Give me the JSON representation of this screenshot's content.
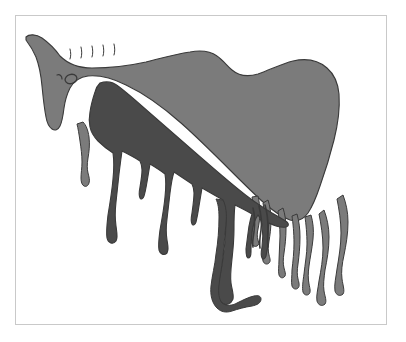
{
  "artwork": {
    "title": "Two-tone horse figure with paint drips",
    "style": "rock-art silhouette illustration",
    "caption": "",
    "background_color": "#ffffff",
    "frame": {
      "border_color": "#c9c9c9",
      "border_width_px": 1,
      "inset_left_px": 15,
      "inset_top_px": 15,
      "width_px": 372,
      "height_px": 310
    },
    "canvas": {
      "width_px": 406,
      "height_px": 342
    },
    "palette": {
      "light_gray": "#7b7b7b",
      "dark_gray": "#4a4a4a",
      "outline": "#3a3a3a",
      "paper": "#ffffff"
    },
    "subject": {
      "name": "horse",
      "orientation": "facing left",
      "parts": [
        "muzzle",
        "head",
        "eye",
        "nostril-mark",
        "mane-ticks",
        "neck",
        "withers",
        "back",
        "rump",
        "belly",
        "legs",
        "paint-drips"
      ]
    },
    "details": {
      "mane_tick_count": 5,
      "drip_count": 12,
      "eye_shape": "oval outline",
      "layers": [
        {
          "label": "light body layer",
          "color": "#7b7b7b"
        },
        {
          "label": "dark overlay layer",
          "color": "#4a4a4a"
        }
      ]
    }
  }
}
